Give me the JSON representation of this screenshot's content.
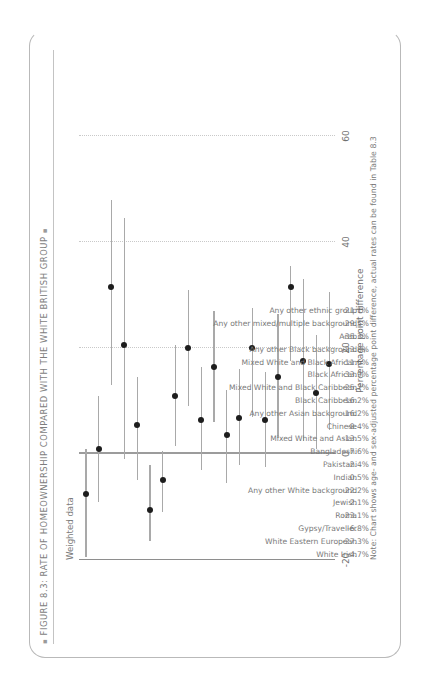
{
  "figure": {
    "title": "FIGURE 8.3: RATE OF HOMEOWNERSHIP COMPARED WITH THE WHITE BRITISH GROUP",
    "bullet": "▪",
    "subtitle": "Weighted data",
    "note": "Note: Chart shows age- and sex-adjusted percentage point difference, actual rates can be found in Table 8.3"
  },
  "chart_data": {
    "type": "scatter",
    "title": "FIGURE 8.3: RATE OF HOMEOWNERSHIP COMPARED WITH THE WHITE BRITISH GROUP",
    "subtitle": "Weighted data",
    "xlabel": "Percentage point difference",
    "ylabel": "",
    "xlim": [
      -20,
      60
    ],
    "xticks": [
      -20,
      0,
      20,
      40,
      60
    ],
    "xticklabels": [
      "-20",
      "0",
      "20",
      "40",
      "60"
    ],
    "grid": "dotted-vertical",
    "legend": "none",
    "orientation": "horizontal-dot-whisker",
    "reference_line": 0,
    "categories": [
      "White Irish",
      "White Eastern European",
      "Gypsy/Traveller",
      "Roma",
      "Jewish",
      "Any other White background",
      "Indian",
      "Pakistani",
      "Bangladeshi",
      "Mixed White and Asian",
      "Chinese",
      "Any other Asian background",
      "Black Caribbean",
      "Mixed White and Black Caribbean",
      "Black African",
      "Mixed White and Black African",
      "Any other Black background",
      "Arab",
      "Any other mixed/multiple background",
      "Any other ethnic group"
    ],
    "value_labels": [
      "-4.7%",
      "-27.3%",
      "-6.8%",
      "-23.1%",
      "2.1%",
      "-22.2%",
      "0.5%",
      "-2.4%",
      "-7.6%",
      "-13.5%",
      "-8.4%",
      "-16.2%",
      "-16.2%",
      "-25.7%",
      "-33.9%",
      "-11.6%",
      "-23.8%",
      "-35.3%",
      "-29.5%",
      "-21.1%"
    ],
    "values": [
      -4.7,
      -27.3,
      -6.8,
      -23.1,
      2.1,
      -22.2,
      0.5,
      -2.4,
      -7.6,
      -13.5,
      -8.4,
      -16.2,
      -16.2,
      -25.7,
      -33.9,
      -11.6,
      -23.8,
      -35.3,
      -29.5,
      -21.1
    ],
    "points": [
      {
        "category": "White Irish",
        "value": -7.5,
        "low": -19.5,
        "high": 1.0
      },
      {
        "category": "White Eastern European",
        "value": 1.0,
        "low": -9.0,
        "high": 11.0
      },
      {
        "category": "Gypsy/Traveller",
        "value": 31.5,
        "low": 13.0,
        "high": 48.0
      },
      {
        "category": "Roma",
        "value": 20.5,
        "low": -1.0,
        "high": 44.5
      },
      {
        "category": "Jewish",
        "value": 5.5,
        "low": -5.0,
        "high": 14.5
      },
      {
        "category": "Any other White background",
        "value": -10.5,
        "low": -16.5,
        "high": -2.0
      },
      {
        "category": "Indian",
        "value": -5.0,
        "low": -11.0,
        "high": 0.5
      },
      {
        "category": "Pakistani",
        "value": 11.0,
        "low": 1.5,
        "high": 20.5
      },
      {
        "category": "Bangladeshi",
        "value": 20.0,
        "low": 9.0,
        "high": 31.0
      },
      {
        "category": "Mixed White and Asian",
        "value": 6.5,
        "low": -3.0,
        "high": 16.5
      },
      {
        "category": "Chinese",
        "value": 16.5,
        "low": 6.0,
        "high": 27.0
      },
      {
        "category": "Any other Asian background",
        "value": 3.5,
        "low": -5.5,
        "high": 12.0
      },
      {
        "category": "Black Caribbean",
        "value": 6.8,
        "low": -2.0,
        "high": 16.0
      },
      {
        "category": "Mixed White and Black Caribbean",
        "value": 20.0,
        "low": 7.0,
        "high": 27.5
      },
      {
        "category": "Black African",
        "value": 6.5,
        "low": -2.5,
        "high": 15.5
      },
      {
        "category": "Mixed White and Black African",
        "value": 14.5,
        "low": 3.0,
        "high": 26.5
      },
      {
        "category": "Any other Black background",
        "value": 31.5,
        "low": 17.5,
        "high": 35.5
      },
      {
        "category": "Arab",
        "value": 17.5,
        "low": 2.5,
        "high": 33.0
      },
      {
        "category": "Any other mixed/multiple background",
        "value": 11.5,
        "low": 1.0,
        "high": 22.5
      },
      {
        "category": "Any other ethnic group",
        "value": 17.0,
        "low": 4.5,
        "high": 30.5
      }
    ]
  }
}
